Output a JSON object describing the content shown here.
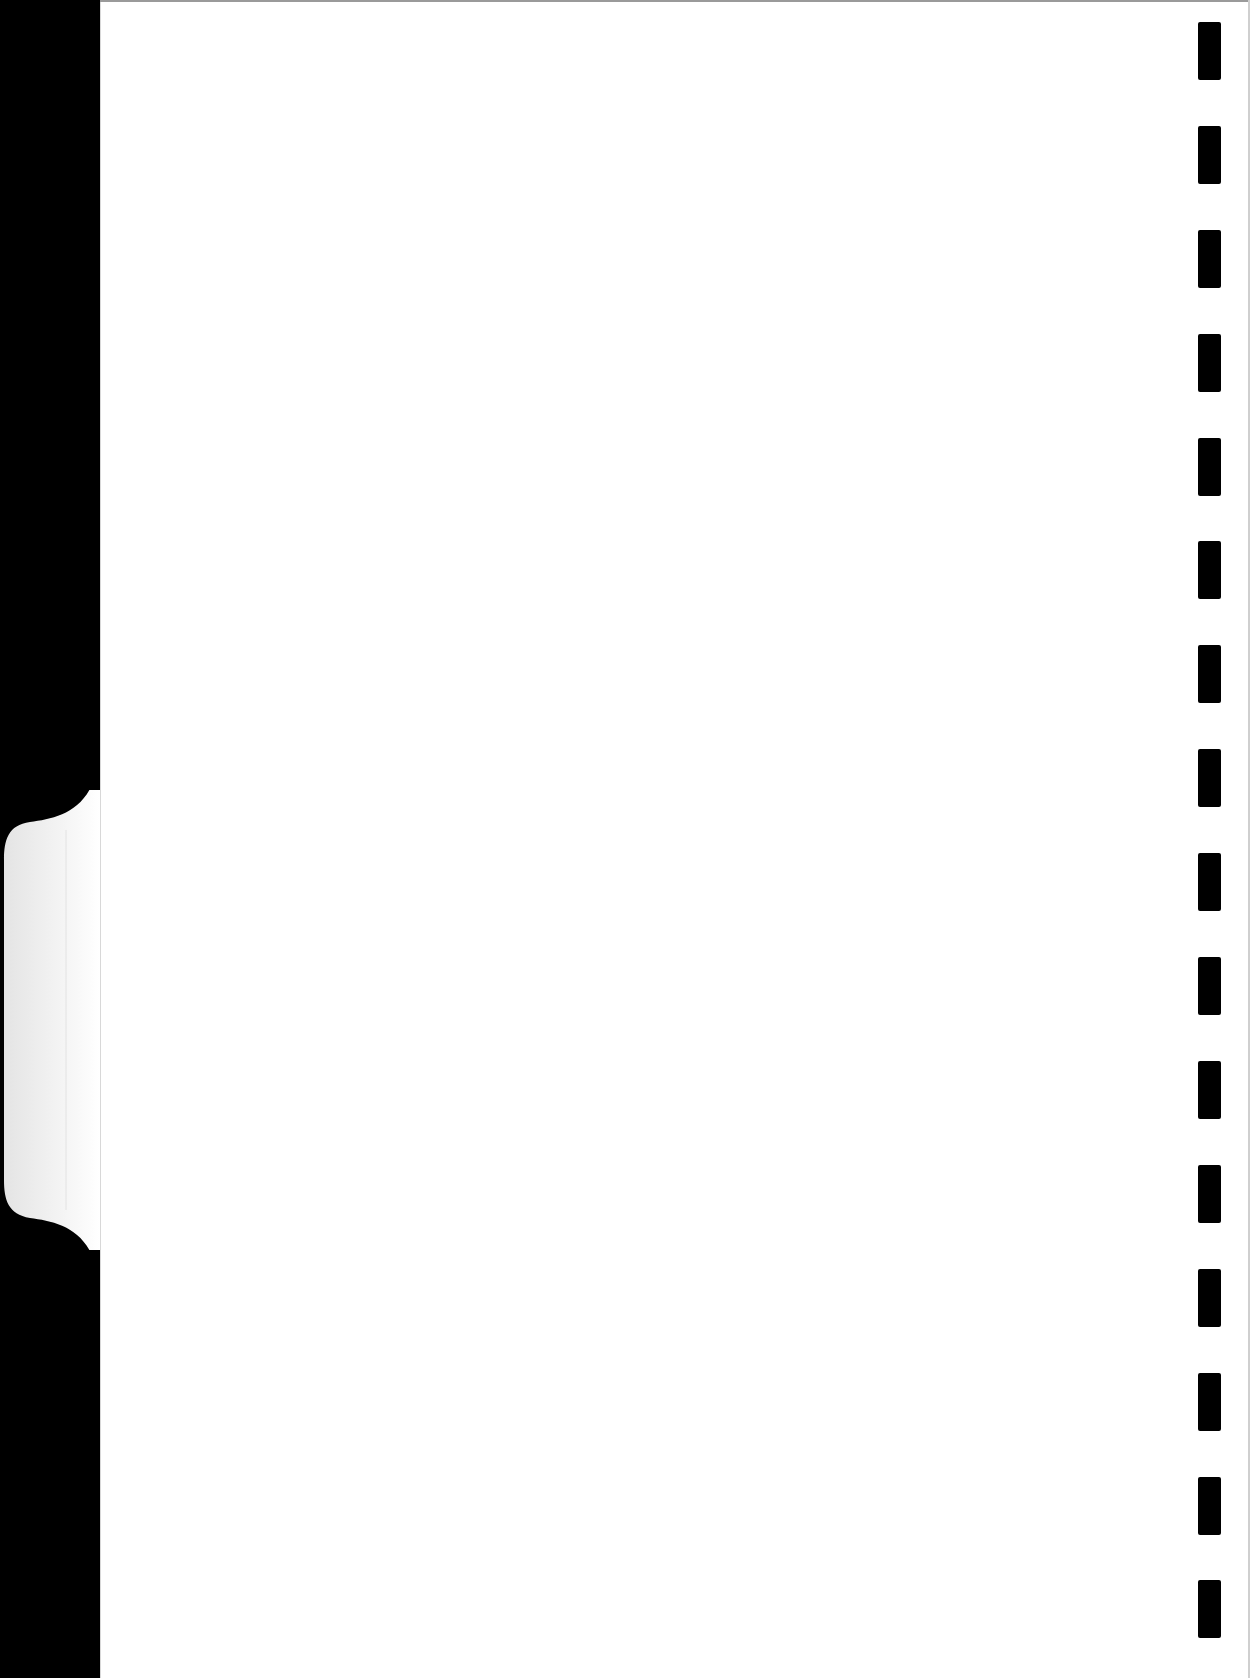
{
  "document": {
    "type": "blank scanned page with tab divider",
    "text_content": ""
  },
  "colors": {
    "page": "#ffffff",
    "margin": "#000000",
    "tab": "#f2f2f2",
    "binding_marks": "#000000"
  },
  "binding_marks": {
    "count": 16,
    "positions_y": [
      22,
      126,
      230,
      334,
      438,
      541,
      645,
      749,
      853,
      957,
      1061,
      1165,
      1269,
      1373,
      1477,
      1580
    ]
  },
  "tab": {
    "top_y": 790,
    "bottom_y": 1250,
    "label": ""
  }
}
